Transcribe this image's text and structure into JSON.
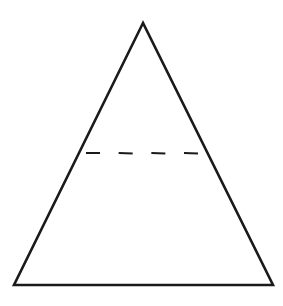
{
  "diagram": {
    "type": "triangle",
    "stroke_color": "#1a1a1a",
    "background": "#ffffff",
    "triangle": {
      "apex": [
        143,
        23
      ],
      "bottom_left": [
        14,
        285
      ],
      "bottom_right": [
        273,
        285
      ]
    },
    "dashed_line": {
      "y": 153,
      "x_start": 86,
      "x_end": 198,
      "dash_count": 4
    }
  }
}
